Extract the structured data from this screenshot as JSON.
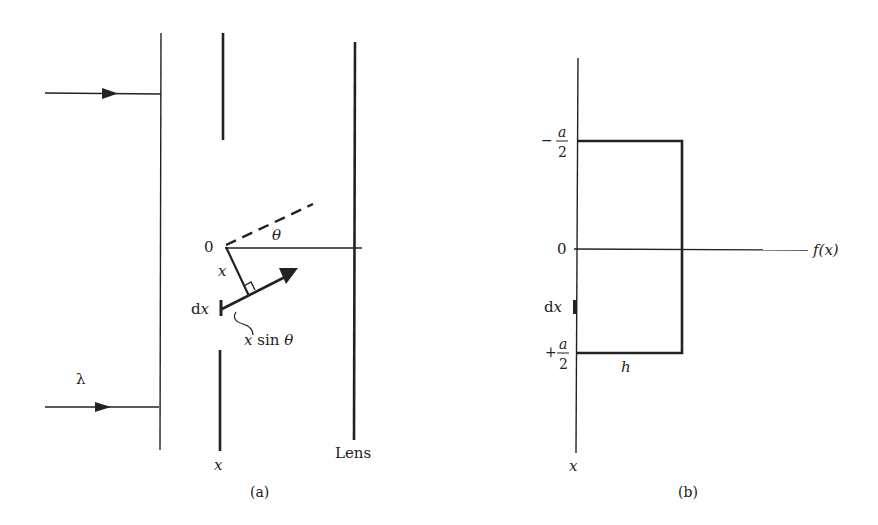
{
  "figure_a": {
    "caption": "(a)",
    "wavelength_label": "λ",
    "origin_label": "0",
    "angle_label": "θ",
    "distance_label": "x",
    "element_label_d": "d",
    "element_label_x": "x",
    "path_difference_label": "x sin θ",
    "slit_axis_label": "x",
    "lens_label": "Lens",
    "incident_rays": 2
  },
  "figure_b": {
    "caption": "(b)",
    "top_edge_label_sign": "−",
    "top_edge_label_num": "a",
    "top_edge_label_den": "2",
    "zero_label": "0",
    "bottom_edge_label_sign": "+",
    "bottom_edge_label_num": "a",
    "bottom_edge_label_den": "2",
    "element_label_d": "d",
    "element_label_x": "x",
    "height_label": "h",
    "horizontal_axis_label": "f(x)",
    "vertical_axis_label": "x"
  },
  "colors": {
    "ink": "#222222",
    "background": "#ffffff"
  }
}
